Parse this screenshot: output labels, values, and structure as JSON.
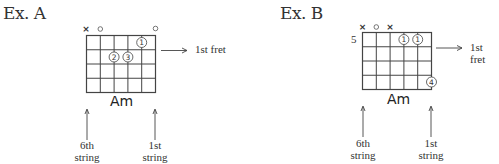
{
  "examples": [
    {
      "title": "Ex. A",
      "chord_name": "Am",
      "position_label": "",
      "fret_pointer_label": "1st fret",
      "left_string_label": [
        "6th",
        "string"
      ],
      "right_string_label": [
        "1st",
        "string"
      ],
      "strings": 6,
      "frets_shown": 4,
      "open_muted": [
        {
          "string": 6,
          "symbol": "x"
        },
        {
          "string": 5,
          "symbol": "o"
        },
        {
          "string": 1,
          "symbol": "o"
        }
      ],
      "fingers": [
        {
          "string": 2,
          "fret": 1,
          "finger": "1"
        },
        {
          "string": 4,
          "fret": 2,
          "finger": "2"
        },
        {
          "string": 3,
          "fret": 2,
          "finger": "3"
        }
      ]
    },
    {
      "title": "Ex. B",
      "chord_name": "Am",
      "position_label": "5",
      "fret_pointer_label": "1st fret",
      "left_string_label": [
        "6th",
        "string"
      ],
      "right_string_label": [
        "1st",
        "string"
      ],
      "strings": 6,
      "frets_shown": 4,
      "open_muted": [
        {
          "string": 6,
          "symbol": "x"
        },
        {
          "string": 5,
          "symbol": "o"
        },
        {
          "string": 4,
          "symbol": "x"
        }
      ],
      "fingers": [
        {
          "string": 3,
          "fret": 1,
          "finger": "1"
        },
        {
          "string": 2,
          "fret": 1,
          "finger": "1"
        },
        {
          "string": 1,
          "fret": 4,
          "finger": "4"
        }
      ]
    }
  ],
  "colors": {
    "ink": "#333333",
    "background": "#ffffff"
  }
}
